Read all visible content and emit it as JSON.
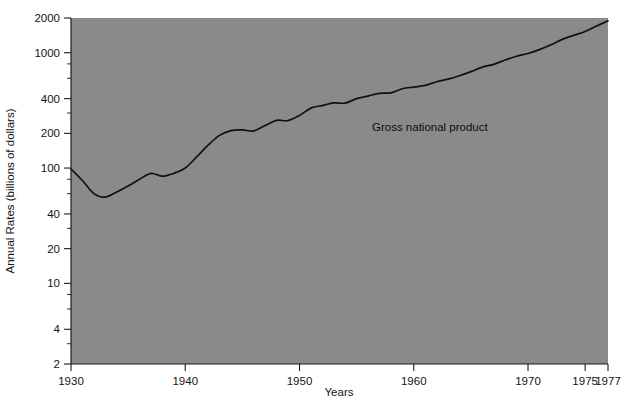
{
  "chart_data": {
    "type": "line",
    "title": "",
    "xlabel": "Years",
    "ylabel": "Annual Rates (billions of dollars)",
    "yscale": "log",
    "xlim": [
      1930,
      1977
    ],
    "ylim": [
      2,
      2000
    ],
    "grid": false,
    "legend_position": "inline-annotation",
    "plot_background_color": "#8a8a8a",
    "line_color": "#111111",
    "xticks": [
      1930,
      1940,
      1950,
      1960,
      1970,
      1975,
      1977
    ],
    "xtick_labels": [
      "1930",
      "1940",
      "1950",
      "1960",
      "1970",
      "1975",
      "1977"
    ],
    "yticks": [
      2,
      4,
      10,
      20,
      40,
      100,
      200,
      400,
      1000,
      2000
    ],
    "ytick_labels": [
      "2",
      "4",
      "10",
      "20",
      "40",
      "100",
      "200",
      "400",
      "1000",
      "2000"
    ],
    "yticks_minor": [
      3,
      6,
      8,
      30,
      60,
      80,
      300,
      600,
      800
    ],
    "annotations": [
      {
        "text": "Gross national product",
        "x": 1957.5,
        "y": 330
      }
    ],
    "series": [
      {
        "name": "Gross national product",
        "x": [
          1930,
          1931,
          1932,
          1933,
          1934,
          1935,
          1936,
          1937,
          1938,
          1939,
          1940,
          1941,
          1942,
          1943,
          1944,
          1945,
          1946,
          1947,
          1948,
          1949,
          1950,
          1951,
          1952,
          1953,
          1954,
          1955,
          1956,
          1957,
          1958,
          1959,
          1960,
          1961,
          1962,
          1963,
          1964,
          1965,
          1966,
          1967,
          1968,
          1969,
          1970,
          1971,
          1972,
          1973,
          1974,
          1975,
          1976,
          1977
        ],
        "values": [
          98,
          78,
          60,
          56,
          62,
          70,
          80,
          90,
          85,
          90,
          100,
          125,
          158,
          192,
          211,
          214,
          210,
          234,
          259,
          258,
          286,
          331,
          348,
          367,
          366,
          400,
          421,
          444,
          449,
          487,
          504,
          521,
          560,
          590,
          632,
          685,
          750,
          793,
          865,
          932,
          985,
          1063,
          1171,
          1306,
          1413,
          1529,
          1702,
          1890
        ],
        "units": "billions of dollars"
      }
    ]
  },
  "figure": {
    "caption": "",
    "series_label": "Gross national product"
  }
}
